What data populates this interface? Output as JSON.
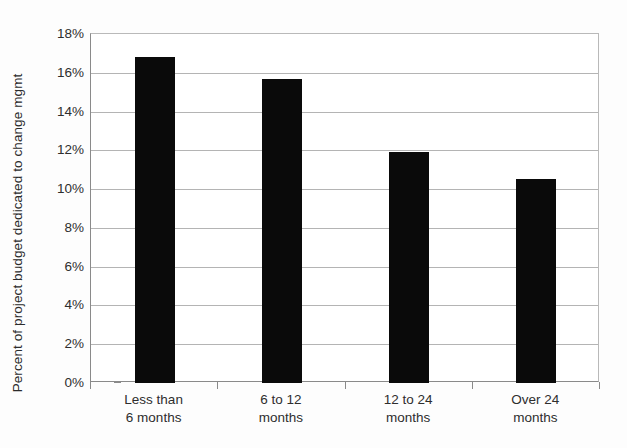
{
  "chart_data": {
    "type": "bar",
    "title": "",
    "xlabel": "",
    "ylabel": "Percent of project budget dedicated to change mgmt",
    "categories": [
      "Less than\n6 months",
      "6 to 12\nmonths",
      "12 to 24\nmonths",
      "Over 24\nmonths"
    ],
    "values": [
      16.8,
      15.7,
      11.9,
      10.5
    ],
    "ylim": [
      0,
      18
    ],
    "ytick_labels": [
      "18%",
      "16%",
      "14%",
      "12%",
      "10%",
      "8%",
      "6%",
      "4%",
      "2%",
      "0%"
    ],
    "ytick_values": [
      18,
      16,
      14,
      12,
      10,
      8,
      6,
      4,
      2,
      0
    ],
    "grid": true,
    "legend": "none",
    "bar_color": "#0a0a0a",
    "gridline_color": "#b4b4b4",
    "axis_color": "#8a8a8a",
    "background_color": "#fdfdfd"
  }
}
